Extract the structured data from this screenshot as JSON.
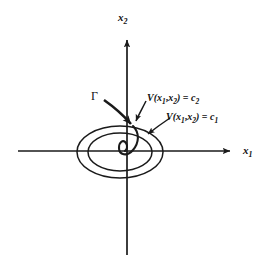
{
  "figure": {
    "title": "",
    "background_color": "#ffffff",
    "stroke_color": "#1a1a1a",
    "width": 267,
    "height": 267
  },
  "axes": {
    "x_axis": {
      "name": "x1-axis",
      "label_base": "x",
      "label_sub": "1",
      "y_pixel": 151,
      "x_start": 18,
      "x_end": 237,
      "arrow": "right"
    },
    "y_axis": {
      "name": "x2-axis",
      "label_base": "x",
      "label_sub": "2",
      "x_pixel": 127,
      "y_start": 255,
      "y_end": 33,
      "arrow": "up"
    }
  },
  "curves": {
    "outer_level_set": {
      "name": "V-level-set-c1",
      "label_func": "V(",
      "label_arg1": "x",
      "label_arg1_sub": "1",
      "label_comma": ",",
      "label_arg2": "x",
      "label_arg2_sub": "2",
      "label_close": ")",
      "label_eq": " = ",
      "label_const": "c",
      "label_const_sub": "1",
      "full_text": "V(x1,x2) = c1",
      "cx": 120,
      "cy": 152,
      "rx": 43,
      "ry": 26
    },
    "inner_level_set": {
      "name": "V-level-set-c2",
      "label_func": "V(",
      "label_arg1": "x",
      "label_arg1_sub": "1",
      "label_comma": ",",
      "label_arg2": "x",
      "label_arg2_sub": "2",
      "label_close": ")",
      "label_eq": " = ",
      "label_const": "c",
      "label_const_sub": "2",
      "full_text": "V(x1,x2) = c2",
      "cx": 120,
      "cy": 152,
      "rx": 32,
      "ry": 19
    },
    "trajectory": {
      "name": "trajectory-gamma",
      "label": "Γ",
      "description": "inward spiral trajectory crossing the level sets toward the origin"
    }
  },
  "annotations": [
    {
      "name": "gamma-arrow",
      "points_to": "trajectory-gamma",
      "from": [
        104,
        100
      ],
      "to": [
        133,
        127
      ]
    },
    {
      "name": "c2-arrow",
      "points_to": "inner-level-set",
      "from": [
        146,
        100
      ],
      "to": [
        135,
        122
      ]
    },
    {
      "name": "c1-arrow",
      "points_to": "outer-level-set",
      "from": [
        168,
        117
      ],
      "to": [
        147,
        135
      ]
    }
  ]
}
